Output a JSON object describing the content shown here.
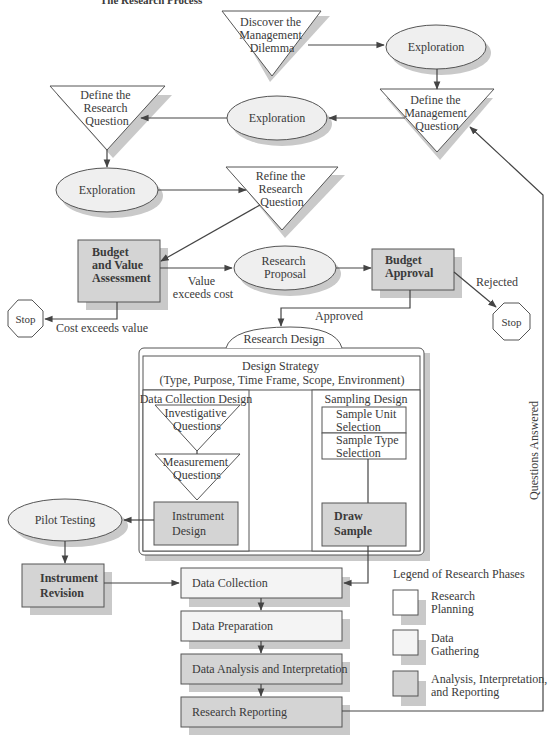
{
  "header": {
    "partial_caption": "The Research Process"
  },
  "colors": {
    "planning_fill": "#ffffff",
    "gathering_fill": "#f4f4f4",
    "analysis_fill": "#d4d4d4",
    "ellipse_fill": "#efefef",
    "shadow": "#c9c9c9",
    "stroke": "#555555"
  },
  "nodes": {
    "discover": {
      "lines": [
        "Discover the",
        "Management",
        "Dilemma"
      ]
    },
    "exploration_1": {
      "label": "Exploration"
    },
    "define_management": {
      "lines": [
        "Define the",
        "Management",
        "Question"
      ]
    },
    "exploration_2": {
      "label": "Exploration"
    },
    "define_research": {
      "lines": [
        "Define the",
        "Research",
        "Question"
      ]
    },
    "exploration_3": {
      "label": "Exploration"
    },
    "refine_research": {
      "lines": [
        "Refine the",
        "Research",
        "Question"
      ]
    },
    "budget_value": {
      "lines": [
        "Budget",
        "and Value",
        "Assessment"
      ]
    },
    "research_proposal": {
      "lines": [
        "Research",
        "Proposal"
      ]
    },
    "budget_approval": {
      "lines": [
        "Budget",
        "Approval"
      ]
    },
    "stop_left": {
      "label": "Stop"
    },
    "stop_right": {
      "label": "Stop"
    },
    "research_design": {
      "tab": "Research Design",
      "strategy_lines": [
        "Design Strategy",
        "(Type, Purpose, Time Frame, Scope, Environment)"
      ],
      "data_collection": {
        "title": "Data Collection Design",
        "investigative": [
          "Investigative",
          "Questions"
        ],
        "measurement": [
          "Measurement",
          "Questions"
        ],
        "instrument": [
          "Instrument",
          "Design"
        ]
      },
      "sampling": {
        "title": "Sampling Design",
        "unit": [
          "Sample Unit",
          "Selection"
        ],
        "type": [
          "Sample Type",
          "Selection"
        ],
        "draw": [
          "Draw",
          "Sample"
        ]
      }
    },
    "pilot_testing": {
      "label": "Pilot Testing"
    },
    "instrument_revision": {
      "lines": [
        "Instrument",
        "Revision"
      ]
    },
    "data_collection": {
      "label": "Data Collection"
    },
    "data_preparation": {
      "label": "Data Preparation"
    },
    "data_analysis": {
      "label": "Data Analysis and Interpretation"
    },
    "research_reporting": {
      "label": "Research Reporting"
    }
  },
  "edge_labels": {
    "value_exceeds_cost": [
      "Value",
      "exceeds cost"
    ],
    "cost_exceeds_value": "Cost exceeds value",
    "rejected": "Rejected",
    "approved": "Approved",
    "questions_answered": "Questions Answered"
  },
  "legend": {
    "title": "Legend of Research Phases",
    "items": [
      {
        "lines": [
          "Research",
          "Planning"
        ],
        "fill": "#ffffff"
      },
      {
        "lines": [
          "Data",
          "Gathering"
        ],
        "fill": "#f4f4f4"
      },
      {
        "lines": [
          "Analysis, Interpretation,",
          "and Reporting"
        ],
        "fill": "#d4d4d4"
      }
    ]
  }
}
